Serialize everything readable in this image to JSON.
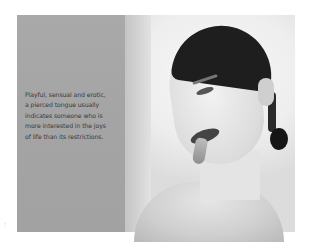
{
  "page": {
    "type": "book-page",
    "photo": {
      "subject": "black-and-white portrait of a woman with a pierced tongue",
      "panel_color": "#a6a6a6",
      "background_color": "#eeeeee"
    },
    "caption": {
      "lines": [
        "Playful, sensual and erotic,",
        "a pierced tongue usually",
        "indicates someone who is",
        "more interested in the joys",
        "of life than its restrictions."
      ]
    },
    "margin_mark": ":"
  }
}
